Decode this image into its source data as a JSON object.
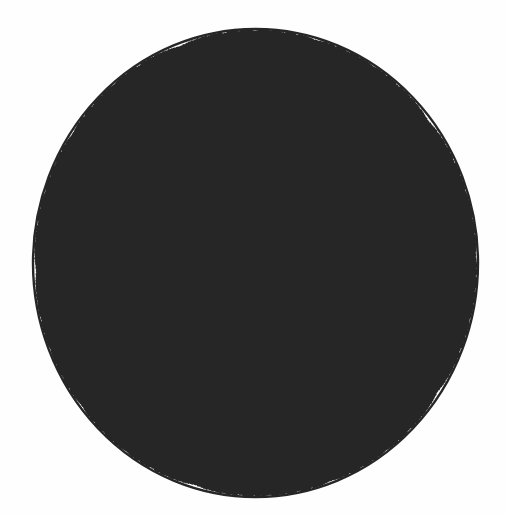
{
  "figure": {
    "name": "hyperbolic-tessellation-poincare-disk",
    "caption": "",
    "model": "Poincare disk model",
    "schlafli_symbol": "{5,4}",
    "polygon_sides": 5,
    "polygons_per_vertex": 4,
    "vertex_angle_degrees": 90,
    "recursion_depth": 7,
    "background_color": "#fefefe",
    "stroke_color": "#262626",
    "boundary_stroke_width": 2.4,
    "edge_stroke_width": 2.0,
    "canvas": {
      "width": 507,
      "height": 514
    }
  },
  "disk": {
    "center_x": 255.5,
    "center_y": 263.0,
    "radius_x": 222.5,
    "radius_y": 234.0,
    "rotation_degrees": -20.0
  },
  "central_cell": {
    "label": "central-pentagon",
    "vertices_px": [
      {
        "x": 207,
        "y": 188
      },
      {
        "x": 312,
        "y": 188
      },
      {
        "x": 347,
        "y": 293
      },
      {
        "x": 260,
        "y": 355
      },
      {
        "x": 172,
        "y": 293
      }
    ],
    "centroid_px": {
      "x": 260,
      "y": 263
    }
  },
  "chart_data": {
    "type": "diagram",
    "notation": "{5,4}",
    "p": 5,
    "q": 4,
    "angle_sum_per_vertex_degrees": 360,
    "interior_angle_degrees": 90,
    "boundary": "unit circle (circle at infinity)",
    "grid": false,
    "legend": []
  }
}
